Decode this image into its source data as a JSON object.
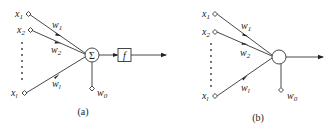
{
  "diagrams": [
    {
      "id": "a",
      "caption": "(a)",
      "inputs": [
        {
          "name": "x1",
          "base": "x",
          "sub": "1"
        },
        {
          "name": "x2",
          "base": "x",
          "sub": "2"
        },
        {
          "name": "xl",
          "base": "x",
          "sub": "l"
        }
      ],
      "weights": [
        {
          "name": "w1",
          "base": "w",
          "sub": "1"
        },
        {
          "name": "w2",
          "base": "w",
          "sub": "2"
        },
        {
          "name": "wl",
          "base": "w",
          "sub": "l"
        }
      ],
      "bias": {
        "base": "w",
        "sub": "0"
      },
      "summation_symbol": "Σ",
      "activation_symbol": "f"
    },
    {
      "id": "b",
      "caption": "(b)",
      "inputs": [
        {
          "name": "x1",
          "base": "x",
          "sub": "1"
        },
        {
          "name": "x2",
          "base": "x",
          "sub": "2"
        },
        {
          "name": "xl",
          "base": "x",
          "sub": "l"
        }
      ],
      "weights": [
        {
          "name": "w1",
          "base": "w",
          "sub": "1"
        },
        {
          "name": "w2",
          "base": "w",
          "sub": "2"
        },
        {
          "name": "wl",
          "base": "w",
          "sub": "l"
        }
      ],
      "bias": {
        "base": "w",
        "sub": "0"
      }
    }
  ]
}
